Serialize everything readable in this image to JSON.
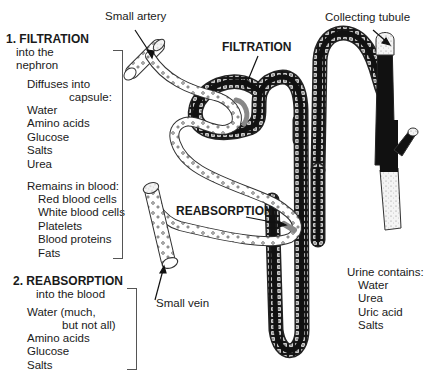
{
  "diagram": {
    "callouts": {
      "small_artery": "Small artery",
      "collecting_tubule": "Collecting tubule",
      "filtration": "FILTRATION",
      "reabsorption": "REABSORPTION",
      "small_vein": "Small vein"
    },
    "filtration_section": {
      "heading": "1. FILTRATION",
      "subheading_line1": "into the",
      "subheading_line2": "nephron",
      "diffuses_label_line1": "Diffuses into",
      "diffuses_label_line2": "capsule:",
      "diffuses_items": [
        "Water",
        "Amino acids",
        "Glucose",
        "Salts",
        "Urea"
      ],
      "remains_label": "Remains in blood:",
      "remains_items": [
        "Red blood cells",
        "White blood cells",
        "Platelets",
        "Blood proteins",
        "Fats"
      ]
    },
    "reabsorption_section": {
      "heading": "2. REABSORPTION",
      "subheading": "into the blood",
      "items_line1": "Water (much,",
      "items_line2": "but not all)",
      "items": [
        "Amino acids",
        "Glucose",
        "Salts"
      ]
    },
    "urine_section": {
      "heading": "Urine contains:",
      "items": [
        "Water",
        "Urea",
        "Uric acid",
        "Salts"
      ]
    },
    "colors": {
      "tubule_fill": "#111111",
      "vessel_fill": "#ffffff",
      "outline": "#222222"
    }
  }
}
